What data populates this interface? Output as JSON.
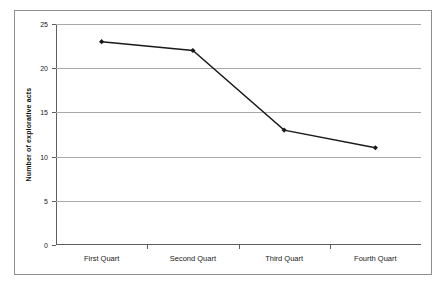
{
  "chart_data": {
    "type": "line",
    "title": "",
    "subtitle": "",
    "xlabel": "",
    "ylabel": "Number of explorative acts",
    "categories": [
      "First Quart",
      "Second Quart",
      "Third Quart",
      "Fourth Quart"
    ],
    "series": [
      {
        "name": "Number of explorative acts",
        "values": [
          23,
          22,
          13,
          11
        ],
        "marker": "filled-diamond",
        "color": "#1a1a1a"
      }
    ],
    "ylim": [
      0,
      25
    ],
    "yticks": [
      0,
      5,
      10,
      15,
      20,
      25
    ],
    "ytick_labels": [
      "0",
      "5",
      "10",
      "15",
      "20",
      "25"
    ],
    "grid": {
      "horizontal": true,
      "vertical": false,
      "color": "#a9a9a9"
    },
    "legend": {
      "visible": false,
      "position": "none"
    },
    "axis_color": "#5d5d5d",
    "border_color": "#8d8d8d",
    "background": "#ffffff"
  }
}
